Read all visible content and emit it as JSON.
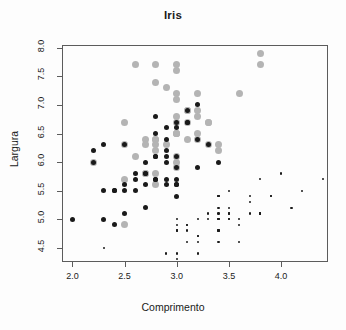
{
  "title": "Iris",
  "axes": {
    "xlabel": "Comprimento",
    "ylabel": "Largura",
    "xticks": [
      "2.0",
      "2.5",
      "3.0",
      "3.5",
      "4.0"
    ],
    "yticks": [
      "4.5",
      "5.0",
      "5.5",
      "6.0",
      "6.5",
      "7.0",
      "7.5",
      "8.0"
    ]
  },
  "colors": {
    "setosa": "#1a1a1a",
    "versicolor": "#1a1a1a",
    "virginica": "#b4b4b4",
    "frame": "#5c5c5c",
    "text": "#1a1a1a",
    "background": "#fdfdfd"
  },
  "chart_data": {
    "type": "scatter",
    "title": "Iris",
    "xlabel": "Comprimento",
    "ylabel": "Largura",
    "xlim": [
      1.9,
      4.45
    ],
    "ylim": [
      4.25,
      8.05
    ],
    "xticks": [
      2.0,
      2.5,
      3.0,
      3.5,
      4.0
    ],
    "yticks": [
      4.5,
      5.0,
      5.5,
      6.0,
      6.5,
      7.0,
      7.5,
      8.0
    ],
    "grid": false,
    "legend": "none",
    "series": [
      {
        "name": "setosa",
        "color": "#1a1a1a",
        "size": 2.2,
        "x": [
          3.5,
          3.0,
          3.2,
          3.1,
          3.6,
          3.9,
          3.4,
          3.4,
          2.9,
          3.1,
          3.7,
          3.4,
          3.0,
          3.0,
          4.0,
          4.4,
          3.9,
          3.5,
          3.8,
          3.8,
          3.4,
          3.7,
          3.6,
          3.3,
          3.4,
          3.0,
          3.4,
          3.5,
          3.4,
          3.2,
          3.1,
          3.4,
          4.1,
          4.2,
          3.1,
          3.2,
          3.5,
          3.6,
          3.0,
          3.4,
          3.5,
          2.3,
          3.2,
          3.5,
          3.8,
          3.0,
          3.8,
          3.2,
          3.7,
          3.3
        ],
        "y": [
          5.1,
          4.9,
          4.7,
          4.6,
          5.0,
          5.4,
          4.6,
          5.0,
          4.4,
          4.9,
          5.4,
          4.8,
          4.8,
          4.3,
          5.8,
          5.7,
          5.4,
          5.1,
          5.7,
          5.1,
          5.4,
          5.1,
          4.6,
          5.1,
          4.8,
          5.0,
          5.0,
          5.2,
          5.2,
          4.7,
          4.8,
          5.4,
          5.2,
          5.5,
          4.9,
          5.0,
          5.5,
          4.9,
          4.4,
          5.1,
          5.0,
          4.5,
          4.4,
          5.0,
          5.1,
          4.8,
          5.1,
          4.6,
          5.3,
          5.0
        ]
      },
      {
        "name": "versicolor",
        "color": "#1a1a1a",
        "size": 5.0,
        "x": [
          3.2,
          3.2,
          3.1,
          2.3,
          2.8,
          2.8,
          3.3,
          2.4,
          2.9,
          2.7,
          2.0,
          3.0,
          2.2,
          2.9,
          2.9,
          3.1,
          3.0,
          2.7,
          2.2,
          2.5,
          3.2,
          2.8,
          2.5,
          2.8,
          2.9,
          3.0,
          2.8,
          3.0,
          2.9,
          2.6,
          2.4,
          2.4,
          2.7,
          2.7,
          3.0,
          3.4,
          3.1,
          2.3,
          3.0,
          2.5,
          2.6,
          3.0,
          2.6,
          2.3,
          2.7,
          3.0,
          2.9,
          2.9,
          2.5,
          2.8
        ],
        "y": [
          7.0,
          6.4,
          6.9,
          5.5,
          6.5,
          5.7,
          6.3,
          4.9,
          6.6,
          5.2,
          5.0,
          5.9,
          6.0,
          6.1,
          5.6,
          6.7,
          5.6,
          5.8,
          6.2,
          5.6,
          5.9,
          6.1,
          6.3,
          6.1,
          6.4,
          6.6,
          6.8,
          6.7,
          6.0,
          5.7,
          5.5,
          5.5,
          5.8,
          6.0,
          5.4,
          6.0,
          6.7,
          6.3,
          5.6,
          5.5,
          5.5,
          6.1,
          5.8,
          5.0,
          5.6,
          5.7,
          5.7,
          6.2,
          5.1,
          5.7
        ]
      },
      {
        "name": "virginica",
        "color": "#b4b4b4",
        "size": 7.0,
        "x": [
          3.3,
          2.7,
          3.0,
          2.9,
          3.0,
          3.0,
          2.5,
          2.9,
          2.5,
          3.6,
          3.2,
          2.7,
          3.0,
          2.5,
          2.8,
          3.2,
          3.0,
          3.8,
          2.6,
          2.2,
          3.2,
          2.8,
          2.8,
          2.7,
          3.3,
          3.2,
          2.8,
          3.0,
          2.8,
          3.0,
          2.8,
          3.8,
          2.8,
          2.8,
          2.6,
          3.0,
          3.4,
          3.1,
          3.0,
          3.1,
          3.1,
          3.1,
          2.7,
          3.2,
          3.3,
          3.0,
          2.5,
          3.0,
          3.4,
          3.0
        ],
        "y": [
          6.3,
          5.8,
          7.1,
          6.3,
          6.5,
          7.6,
          4.9,
          7.3,
          6.7,
          7.2,
          6.5,
          6.4,
          6.8,
          5.7,
          5.8,
          6.4,
          6.5,
          7.7,
          7.7,
          6.0,
          6.9,
          5.6,
          7.7,
          6.3,
          6.7,
          7.2,
          6.2,
          6.1,
          6.4,
          7.2,
          7.4,
          7.9,
          6.4,
          6.3,
          6.1,
          7.7,
          6.3,
          6.4,
          6.0,
          6.9,
          6.7,
          6.9,
          5.8,
          6.8,
          6.7,
          6.7,
          6.3,
          6.5,
          6.2,
          5.9
        ]
      }
    ]
  }
}
